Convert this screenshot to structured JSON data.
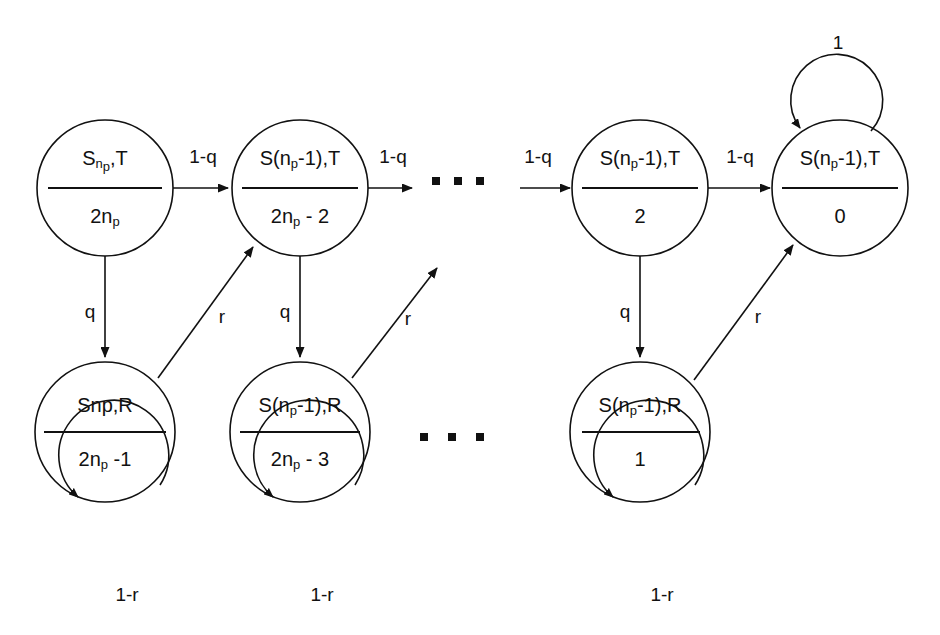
{
  "diagram": {
    "stroke_color": "#111111",
    "background_color": "#ffffff",
    "nodes": [
      {
        "id": "top-1",
        "row": "top",
        "cx": 105,
        "cy": 188,
        "r": 68,
        "numerator_main": "S",
        "numerator_sub": "n",
        "numerator_sub2": "p",
        "numerator_tail": ",T",
        "numerator_plain": "Sn_p,T",
        "denominator_main": "2n",
        "denominator_sub": "p",
        "denominator_tail": "",
        "denominator_plain": "2n_p"
      },
      {
        "id": "top-2",
        "row": "top",
        "cx": 300,
        "cy": 188,
        "r": 68,
        "numerator_main": "S(n",
        "numerator_sub": "p",
        "numerator_tail": "-1),T",
        "numerator_plain": "S(n_p-1),T",
        "denominator_main": "2n",
        "denominator_sub": "p",
        "denominator_tail": " - 2",
        "denominator_plain": "2n_p - 2"
      },
      {
        "id": "top-3",
        "row": "top",
        "cx": 640,
        "cy": 188,
        "r": 68,
        "numerator_main": "S(n",
        "numerator_sub": "p",
        "numerator_tail": "-1),T",
        "numerator_plain": "S(n_p-1),T",
        "denominator_main": "2",
        "denominator_sub": "",
        "denominator_tail": "",
        "denominator_plain": "2"
      },
      {
        "id": "top-4",
        "row": "top",
        "cx": 840,
        "cy": 188,
        "r": 68,
        "numerator_main": "S(n",
        "numerator_sub": "p",
        "numerator_tail": "-1),T",
        "numerator_plain": "S(n_p-1),T",
        "denominator_main": "0",
        "denominator_sub": "",
        "denominator_tail": "",
        "denominator_plain": "0"
      },
      {
        "id": "bottom-1",
        "row": "bottom",
        "cx": 105,
        "cy": 432,
        "r": 70,
        "numerator_main": "Snp,R",
        "numerator_sub": "",
        "numerator_tail": "",
        "numerator_plain": "Snp,R",
        "denominator_main": "2n",
        "denominator_sub": "p",
        "denominator_tail": " -1",
        "denominator_plain": "2n_p -1"
      },
      {
        "id": "bottom-2",
        "row": "bottom",
        "cx": 300,
        "cy": 432,
        "r": 70,
        "numerator_main": "S(n",
        "numerator_sub": "p",
        "numerator_tail": "-1),R",
        "numerator_plain": "S(n_p-1),R",
        "denominator_main": "2n",
        "denominator_sub": "p",
        "denominator_tail": " - 3",
        "denominator_plain": "2n_p - 3"
      },
      {
        "id": "bottom-3",
        "row": "bottom",
        "cx": 640,
        "cy": 432,
        "r": 70,
        "numerator_main": "S(n",
        "numerator_sub": "p",
        "numerator_tail": "-1),R",
        "numerator_plain": "S(n_p-1),R",
        "denominator_main": "1",
        "denominator_sub": "",
        "denominator_tail": "",
        "denominator_plain": "1"
      }
    ],
    "edge_labels": {
      "top_1_to_2": "1-q",
      "top_2_to_dots": "1-q",
      "dots_to_top_3": "1-q",
      "top_3_to_4": "1-q",
      "down_1": "q",
      "down_2": "q",
      "down_3": "q",
      "diag_1": "r",
      "diag_2": "r",
      "diag_3": "r",
      "self_loop_top_4": "1",
      "self_loop_bottom_1": "1-r",
      "self_loop_bottom_2": "1-r",
      "self_loop_bottom_3": "1-r"
    },
    "ellipsis": {
      "top": {
        "cy": 181,
        "dots_x": [
          436,
          458,
          480
        ],
        "size": 7
      },
      "bottom": {
        "cy": 437,
        "dots_x": [
          424,
          452,
          480
        ],
        "size": 7
      }
    }
  }
}
